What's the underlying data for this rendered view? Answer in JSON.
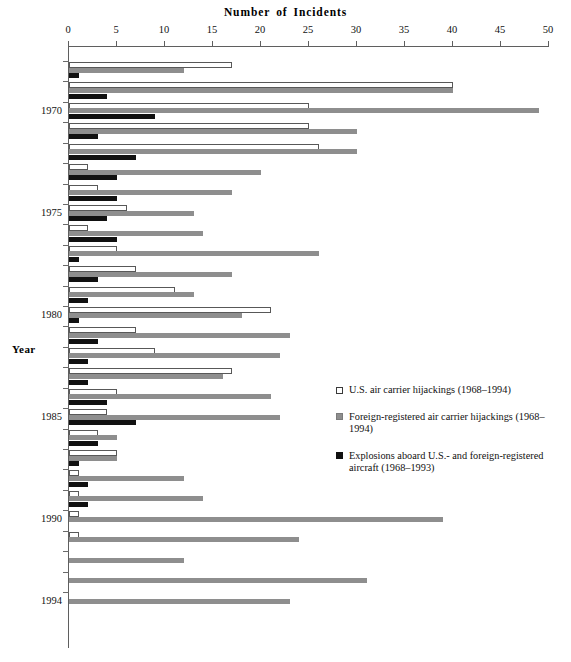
{
  "chart_data": {
    "type": "bar",
    "orientation": "horizontal",
    "xlabel": "Number of Incidents",
    "ylabel": "Year",
    "xlim": [
      0,
      50
    ],
    "xticks": [
      0,
      5,
      10,
      15,
      20,
      25,
      30,
      35,
      40,
      45,
      50
    ],
    "grid": false,
    "legend_position": "middle-right",
    "categories": [
      "1968",
      "1969",
      "1970",
      "1971",
      "1972",
      "1973",
      "1974",
      "1975",
      "1976",
      "1977",
      "1978",
      "1979",
      "1980",
      "1981",
      "1982",
      "1983",
      "1984",
      "1985",
      "1986",
      "1987",
      "1988",
      "1989",
      "1990",
      "1991",
      "1992",
      "1993",
      "1994"
    ],
    "ytick_labels": [
      "1970",
      "1975",
      "1980",
      "1985",
      "1990",
      "1994"
    ],
    "series": [
      {
        "name": "U.S. air carrier hijackings (1968–1994)",
        "color": "#ffffff",
        "values": [
          17,
          40,
          25,
          25,
          26,
          2,
          3,
          6,
          2,
          5,
          7,
          11,
          21,
          7,
          9,
          17,
          5,
          4,
          3,
          5,
          1,
          1,
          1,
          1,
          0,
          0,
          0
        ]
      },
      {
        "name": "Foreign-registered air carrier hijackings (1968–1994)",
        "color": "#8e8e8e",
        "values": [
          12,
          40,
          49,
          30,
          30,
          20,
          17,
          13,
          14,
          26,
          17,
          13,
          18,
          23,
          22,
          16,
          21,
          22,
          5,
          5,
          12,
          14,
          39,
          24,
          12,
          31,
          23
        ]
      },
      {
        "name": "Explosions aboard U.S.-  and foreign-registered aircraft (1968–1993)",
        "color": "#111111",
        "values": [
          1,
          4,
          9,
          3,
          7,
          5,
          5,
          4,
          5,
          1,
          3,
          2,
          1,
          3,
          2,
          2,
          4,
          7,
          3,
          1,
          2,
          2,
          0,
          0,
          0,
          0,
          0
        ]
      }
    ]
  },
  "header": {
    "title_words": [
      "Number",
      "of",
      "Incidents"
    ]
  },
  "axes": {
    "y_axis_title": "Year",
    "x_tick_labels": [
      "0",
      "5",
      "10",
      "15",
      "20",
      "25",
      "30",
      "35",
      "40",
      "45",
      "50"
    ]
  },
  "legend": {
    "items": [
      {
        "swatch": "sw-us",
        "icon": "white-square-swatch",
        "label": "U.S. air carrier hijackings (1968–1994)",
        "label_line2": ""
      },
      {
        "swatch": "sw-foreign",
        "icon": "gray-square-swatch",
        "label": "Foreign-registered air carrier hijackings (1968–1994)",
        "label_line2": ""
      },
      {
        "swatch": "sw-explosions",
        "icon": "black-square-swatch",
        "label": "Explosions aboard U.S.-  and foreign-registered",
        "label_line2": "aircraft (1968–1993)"
      }
    ]
  },
  "footer": {
    "caption": ""
  }
}
